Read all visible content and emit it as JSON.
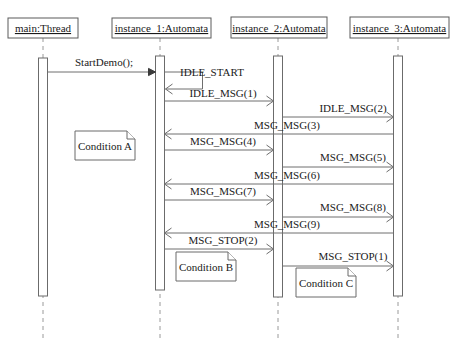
{
  "diagram": {
    "type": "uml-sequence-diagram",
    "width": 461,
    "height": 343,
    "background_color": "#ffffff",
    "line_color": "#6e6e6e",
    "text_color": "#1a1a1a"
  },
  "lifelines": [
    {
      "id": "main",
      "label": "main:Thread",
      "x": 43,
      "head_x": 8,
      "head_y": 18,
      "head_w": 70,
      "head_h": 20,
      "bar_top": 58,
      "bar_bottom": 296,
      "bar_w": 9,
      "dash_bottom": 338
    },
    {
      "id": "instance_1",
      "label": "instance_1:Automata",
      "x": 160,
      "head_x": 112,
      "head_y": 18,
      "head_w": 99,
      "head_h": 20,
      "bar_top": 56,
      "bar_bottom": 290,
      "bar_w": 9,
      "dash_bottom": 338
    },
    {
      "id": "instance_2",
      "label": "instance_2:Automata",
      "x": 278,
      "head_x": 231,
      "head_y": 17,
      "head_w": 96,
      "head_h": 21,
      "bar_top": 56,
      "bar_bottom": 297,
      "bar_w": 9,
      "dash_bottom": 338
    },
    {
      "id": "instance_3",
      "label": "instance_3:Automata",
      "x": 398,
      "head_x": 350,
      "head_y": 17,
      "head_w": 99,
      "head_h": 21,
      "bar_top": 56,
      "bar_bottom": 296,
      "bar_w": 9,
      "dash_bottom": 338
    }
  ],
  "messages": [
    {
      "id": "m1",
      "label": "StartDemo();",
      "from": "main",
      "to": "instance_1",
      "y": 72,
      "direction": "right",
      "arrow_style": "solid",
      "kind": "call",
      "label_x": 104,
      "label_y": 66
    },
    {
      "id": "m2",
      "label": "IDLE_START",
      "from": "instance_1",
      "to": "instance_1",
      "y": 72,
      "y_end": 89,
      "direction": "self",
      "arrow_style": "open",
      "kind": "self-call",
      "label_x": 212,
      "label_y": 76
    },
    {
      "id": "m3",
      "label": "IDLE_MSG(1)",
      "from": "instance_1",
      "to": "instance_2",
      "y": 101,
      "direction": "right",
      "arrow_style": "open",
      "kind": "async",
      "label_x": 223,
      "label_y": 97
    },
    {
      "id": "m4",
      "label": "IDLE_MSG(2)",
      "from": "instance_2",
      "to": "instance_3",
      "y": 117,
      "direction": "right",
      "arrow_style": "open",
      "kind": "async",
      "label_x": 353,
      "label_y": 112
    },
    {
      "id": "m5",
      "label": "MSG_MSG(3)",
      "from": "instance_3",
      "to": "instance_1",
      "y": 134,
      "direction": "left",
      "arrow_style": "open",
      "kind": "return",
      "label_x": 287,
      "label_y": 129
    },
    {
      "id": "m6",
      "label": "MSG_MSG(4)",
      "from": "instance_1",
      "to": "instance_2",
      "y": 150,
      "direction": "right",
      "arrow_style": "open",
      "kind": "async",
      "label_x": 223,
      "label_y": 145
    },
    {
      "id": "m7",
      "label": "MSG_MSG(5)",
      "from": "instance_2",
      "to": "instance_3",
      "y": 167,
      "direction": "right",
      "arrow_style": "open",
      "kind": "async",
      "label_x": 353,
      "label_y": 161
    },
    {
      "id": "m8",
      "label": "MSG_MSG(6)",
      "from": "instance_3",
      "to": "instance_1",
      "y": 184,
      "direction": "left",
      "arrow_style": "open",
      "kind": "return",
      "label_x": 287,
      "label_y": 179
    },
    {
      "id": "m9",
      "label": "MSG_MSG(7)",
      "from": "instance_1",
      "to": "instance_2",
      "y": 200,
      "direction": "right",
      "arrow_style": "open",
      "kind": "async",
      "label_x": 223,
      "label_y": 195
    },
    {
      "id": "m10",
      "label": "MSG_MSG(8)",
      "from": "instance_2",
      "to": "instance_3",
      "y": 217,
      "direction": "right",
      "arrow_style": "open",
      "kind": "async",
      "label_x": 353,
      "label_y": 211
    },
    {
      "id": "m11",
      "label": "MSG_MSG(9)",
      "from": "instance_3",
      "to": "instance_1",
      "y": 233,
      "direction": "left",
      "arrow_style": "open",
      "kind": "return",
      "label_x": 287,
      "label_y": 228
    },
    {
      "id": "m12",
      "label": "MSG_STOP(2)",
      "from": "instance_1",
      "to": "instance_2",
      "y": 249,
      "direction": "right",
      "arrow_style": "open",
      "kind": "async",
      "label_x": 223,
      "label_y": 244
    },
    {
      "id": "m13",
      "label": "MSG_STOP(1)",
      "from": "instance_2",
      "to": "instance_3",
      "y": 266,
      "direction": "right",
      "arrow_style": "open",
      "kind": "async",
      "label_x": 353,
      "label_y": 260
    }
  ],
  "notes": [
    {
      "id": "note_a",
      "label": "Condition A",
      "x": 75,
      "y": 131,
      "w": 60,
      "h": 29,
      "fold": 8
    },
    {
      "id": "note_b",
      "label": "Condition B",
      "x": 176,
      "y": 252,
      "w": 60,
      "h": 29,
      "fold": 8
    },
    {
      "id": "note_c",
      "label": "Condition C",
      "x": 296,
      "y": 268,
      "w": 60,
      "h": 29,
      "fold": 8
    }
  ]
}
